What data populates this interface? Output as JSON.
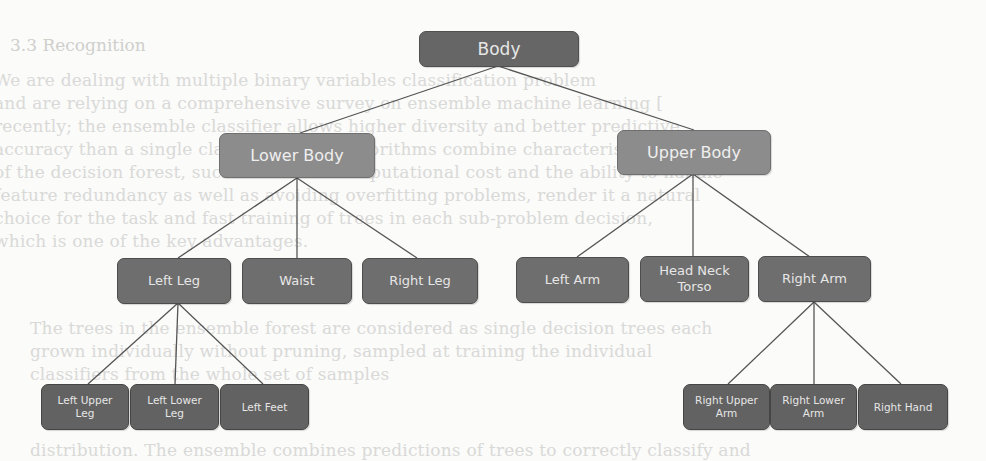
{
  "background_text": {
    "heading": "3.3   Recognition",
    "lines": [
      "We are dealing with multiple binary variables classification problem",
      "and are relying on a comprehensive survey on ensemble machine learning [",
      "recently; the ensemble classifier allows higher diversity and better predictive",
      "accuracy than a single classifier. Many algorithms combine characteristics",
      "of the decision forest, such as the low computational cost and the ability to handle",
      "feature redundancy as well as avoiding overfitting problems, render it a natural",
      "choice for the task and fast training of trees in each sub-problem decision,",
      "which is one of the key advantages.",
      "The trees in the ensemble forest are considered as single decision trees each",
      "grown individually without pruning, sampled at training the individual",
      "classifiers from the whole set of samples",
      "distribution. The ensemble combines predictions of trees to correctly classify and"
    ]
  },
  "diagram": {
    "colors": {
      "root_fill": "#666666",
      "level1_fill": "#8c8c8c",
      "level2_fill": "#6e6e6e",
      "level3_fill": "#626262",
      "text": "#e6e6e6",
      "connector": "#555555"
    },
    "nodes": {
      "body": "Body",
      "lower_body": "Lower Body",
      "upper_body": "Upper Body",
      "left_leg": "Left Leg",
      "waist": "Waist",
      "right_leg": "Right Leg",
      "left_arm": "Left Arm",
      "head_neck_torso": "Head Neck Torso",
      "right_arm": "Right Arm",
      "left_upper_leg": "Left Upper Leg",
      "left_lower_leg": "Left Lower Leg",
      "left_feet": "Left Feet",
      "right_upper_arm": "Right Upper Arm",
      "right_lower_arm": "Right Lower Arm",
      "right_hand": "Right Hand"
    },
    "edges": [
      [
        "Body",
        "Lower Body"
      ],
      [
        "Body",
        "Upper Body"
      ],
      [
        "Lower Body",
        "Left Leg"
      ],
      [
        "Lower Body",
        "Waist"
      ],
      [
        "Lower Body",
        "Right Leg"
      ],
      [
        "Upper Body",
        "Left Arm"
      ],
      [
        "Upper Body",
        "Head Neck Torso"
      ],
      [
        "Upper Body",
        "Right Arm"
      ],
      [
        "Left Leg",
        "Left Upper Leg"
      ],
      [
        "Left Leg",
        "Left Lower Leg"
      ],
      [
        "Left Leg",
        "Left Feet"
      ],
      [
        "Right Arm",
        "Right Upper Arm"
      ],
      [
        "Right Arm",
        "Right Lower Arm"
      ],
      [
        "Right Arm",
        "Right Hand"
      ]
    ]
  }
}
